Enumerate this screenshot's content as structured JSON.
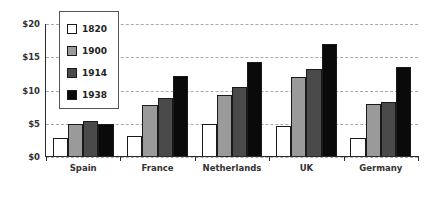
{
  "chart_data": {
    "type": "bar",
    "title": "",
    "xlabel": "",
    "ylabel": "",
    "ylim": [
      0,
      20
    ],
    "yticks": [
      0,
      5,
      10,
      15,
      20
    ],
    "ytick_labels": [
      "$0",
      "$5",
      "$10",
      "$15",
      "$20"
    ],
    "grid": true,
    "legend_position": "upper-left-inside",
    "categories": [
      "Spain",
      "France",
      "Netherlands",
      "UK",
      "Germany"
    ],
    "series": [
      {
        "name": "1820",
        "color": "#ffffff",
        "values": [
          2.8,
          3.1,
          5.0,
          4.6,
          2.8
        ]
      },
      {
        "name": "1900",
        "color": "#9a9a9a",
        "values": [
          4.9,
          7.8,
          9.3,
          12.1,
          8.0
        ]
      },
      {
        "name": "1914",
        "color": "#4a4a4a",
        "values": [
          5.4,
          8.8,
          10.5,
          13.3,
          8.2
        ]
      },
      {
        "name": "1938",
        "color": "#0a0a0a",
        "values": [
          4.9,
          12.2,
          14.3,
          17.0,
          13.5
        ]
      }
    ]
  },
  "legend": {
    "items": [
      {
        "label": "1820"
      },
      {
        "label": "1900"
      },
      {
        "label": "1914"
      },
      {
        "label": "1938"
      }
    ]
  }
}
